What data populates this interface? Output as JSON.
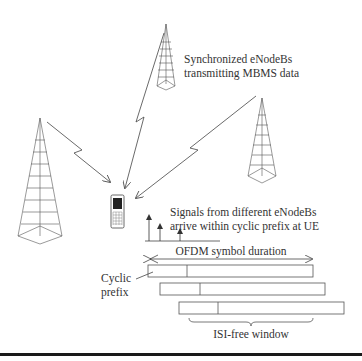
{
  "diagram": {
    "type": "MBMS single-frequency network with synchronized eNodeBs",
    "labels": {
      "enodebs_line1": "Synchronized eNodeBs",
      "enodebs_line2": "transmitting MBMS data",
      "signals_line1": "Signals from different eNodeBs",
      "signals_line2": "arrive within cyclic prefix at UE",
      "ofdm_duration": "OFDM symbol duration",
      "cyclic_line1": "Cyclic",
      "cyclic_line2": "prefix",
      "isi_window": "ISI-free window"
    },
    "nodes": [
      {
        "id": "tower-top",
        "kind": "eNodeB"
      },
      {
        "id": "tower-left",
        "kind": "eNodeB"
      },
      {
        "id": "tower-right",
        "kind": "eNodeB"
      },
      {
        "id": "ue",
        "kind": "UE handset"
      }
    ],
    "edges": [
      {
        "from": "tower-top",
        "to": "ue",
        "style": "lightning-arrow"
      },
      {
        "from": "tower-left",
        "to": "ue",
        "style": "lightning-arrow"
      },
      {
        "from": "tower-right",
        "to": "ue",
        "style": "lightning-arrow"
      }
    ],
    "symbols": [
      {
        "label": "symbol-1",
        "cp_ratio": 0.24
      },
      {
        "label": "symbol-2",
        "cp_ratio": 0.24
      },
      {
        "label": "symbol-3",
        "cp_ratio": 0.24
      }
    ],
    "impulses": 3
  }
}
